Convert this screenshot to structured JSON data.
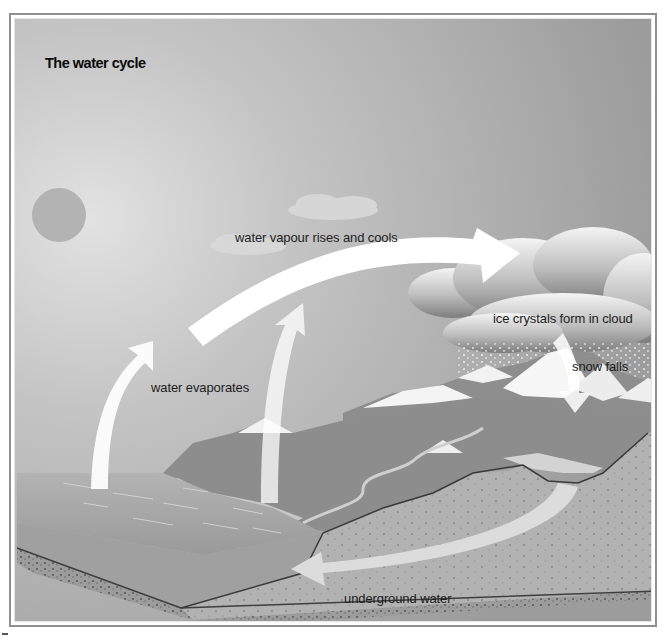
{
  "diagram": {
    "title": "The water cycle",
    "labels": {
      "vapour": "water vapour rises and cools",
      "ice": "ice crystals form in cloud",
      "snow": "snow falls",
      "evaporates": "water evaporates",
      "underground": "underground water"
    },
    "elements": [
      "sun",
      "sea",
      "coastline",
      "mountains",
      "snow-capped peaks",
      "clouds",
      "river",
      "lake",
      "ground cross-section"
    ],
    "colors": {
      "sky": "#a9a9a9",
      "sky_light": "#d9d9d9",
      "sun": "#b6b6b6",
      "sea": "#a3a3a3",
      "ground": "#b4b4b4",
      "arrow": "#ffffff",
      "frame": "#8f8f8f"
    }
  }
}
